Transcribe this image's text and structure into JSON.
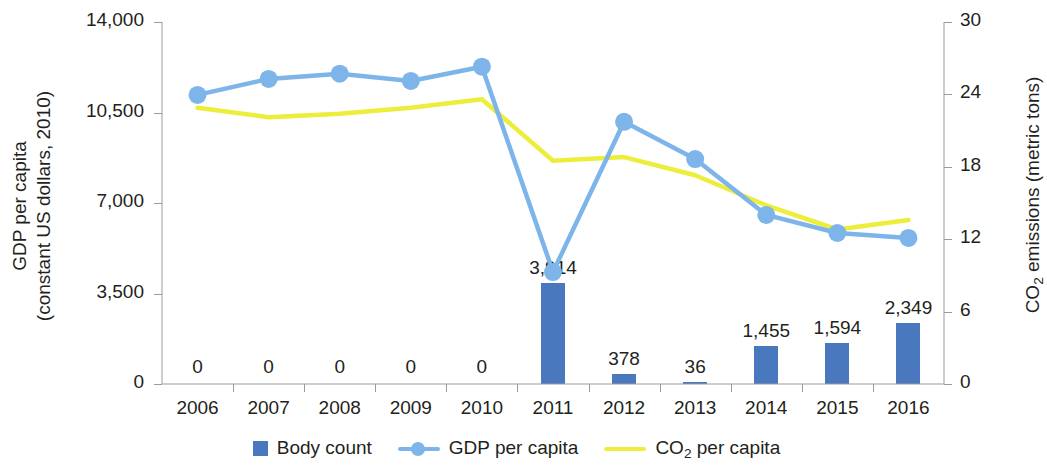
{
  "chart_data": {
    "type": "bar",
    "title": "",
    "categories": [
      "2006",
      "2007",
      "2008",
      "2009",
      "2010",
      "2011",
      "2012",
      "2013",
      "2014",
      "2015",
      "2016"
    ],
    "xlabel": "",
    "ylabel": "GDP per capita (constant US dollars, 2010)",
    "y2label": "CO2 emissions (metric tons)",
    "ylim": [
      0,
      14000
    ],
    "y2lim": [
      0,
      30
    ],
    "yticks": [
      "0",
      "3,500",
      "7,000",
      "10,500",
      "14,000"
    ],
    "ytick_values": [
      0,
      3500,
      7000,
      10500,
      14000
    ],
    "y2ticks": [
      "0",
      "6",
      "12",
      "18",
      "24",
      "30"
    ],
    "y2tick_values": [
      0,
      6,
      12,
      18,
      24,
      30
    ],
    "grid": false,
    "legend_position": "bottom",
    "series": [
      {
        "name": "Body count",
        "type": "bar",
        "axis": "left",
        "color": "#4a78be",
        "values": [
          0,
          0,
          0,
          0,
          0,
          3914,
          378,
          36,
          1455,
          1594,
          2349
        ],
        "labels": [
          "0",
          "0",
          "0",
          "0",
          "0",
          "3,914",
          "378",
          "36",
          "1,455",
          "1,594",
          "2,349"
        ]
      },
      {
        "name": "GDP per capita",
        "type": "line",
        "axis": "left",
        "color": "#7db5ea",
        "marker": "circle",
        "values": [
          11180,
          11800,
          12000,
          11720,
          12270,
          4330,
          10140,
          8700,
          6540,
          5840,
          5650
        ]
      },
      {
        "name": "CO2 per capita",
        "type": "line",
        "axis": "right",
        "color": "#eded3c",
        "marker": "none",
        "values": [
          22.9,
          22.1,
          22.4,
          22.9,
          23.6,
          18.5,
          18.8,
          17.3,
          14.8,
          12.8,
          13.6
        ]
      }
    ]
  },
  "axes": {
    "left_title_line1": "GDP per capita",
    "left_title_line2": "(constant US dollars, 2010)",
    "right_title_prefix": "CO",
    "right_title_sub": "2",
    "right_title_suffix": " emissions (metric tons)"
  },
  "legend": {
    "items": [
      {
        "label": "Body count",
        "icon": "square-swatch-icon",
        "color": "#4a78be"
      },
      {
        "label": "GDP per capita",
        "icon": "line-marker-swatch-icon",
        "color": "#7db5ea"
      },
      {
        "label_prefix": "CO",
        "label_sub": "2",
        "label_suffix": " per capita",
        "icon": "line-swatch-icon",
        "color": "#eded3c"
      }
    ]
  }
}
